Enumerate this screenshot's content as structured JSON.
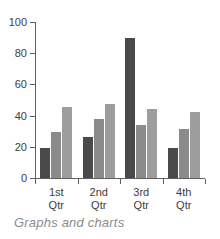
{
  "caption": "Graphs and charts",
  "colors": {
    "background": "#ffffff",
    "axis": "#5f5f5f",
    "tick_text": "#3d3d3d",
    "caption_text": "#8c8c8c",
    "series_1": "#4a4a4a",
    "series_2": "#8b8b8b",
    "series_3": "#9d9d9d"
  },
  "chart_data": {
    "type": "bar",
    "title": "",
    "subtitle": "",
    "xlabel": "",
    "ylabel": "",
    "categories": [
      "1st Qtr",
      "2nd Qtr",
      "3rd Qtr",
      "4th Qtr"
    ],
    "category_lines": [
      [
        "1st",
        "Qtr"
      ],
      [
        "2nd",
        "Qtr"
      ],
      [
        "3rd",
        "Qtr"
      ],
      [
        "4th",
        "Qtr"
      ]
    ],
    "series": [
      {
        "name": "Series 1",
        "color": "#4a4a4a",
        "values": [
          19,
          26.5,
          90,
          19
        ]
      },
      {
        "name": "Series 2",
        "color": "#8b8b8b",
        "values": [
          29.5,
          38,
          34,
          31.5
        ]
      },
      {
        "name": "Series 3",
        "color": "#9d9d9d",
        "values": [
          45.5,
          47.5,
          44.5,
          42.5
        ]
      }
    ],
    "ylim": [
      0,
      100
    ],
    "yticks": [
      0,
      20,
      40,
      60,
      80,
      100
    ],
    "ytick_labels": [
      "0",
      "20",
      "40",
      "60",
      "80",
      "100"
    ],
    "grid": false,
    "legend": false,
    "legend_position": "none"
  }
}
